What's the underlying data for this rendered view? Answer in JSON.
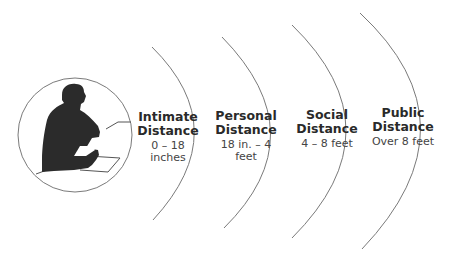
{
  "diagram": {
    "figure": "person-seated-at-desk-silhouette",
    "zones": [
      {
        "name_line1": "Intimate",
        "name_line2": "Distance",
        "range": "0 – 18 inches"
      },
      {
        "name_line1": "Personal",
        "name_line2": "Distance",
        "range": "18 in. – 4 feet"
      },
      {
        "name_line1": "Social",
        "name_line2": "Distance",
        "range": "4 – 8 feet"
      },
      {
        "name_line1": "Public",
        "name_line2": "Distance",
        "range": "Over 8 feet"
      }
    ],
    "colors": {
      "line": "#7a7a7a",
      "silhouette": "#2b2b2b",
      "text": "#2a2a2a"
    }
  }
}
